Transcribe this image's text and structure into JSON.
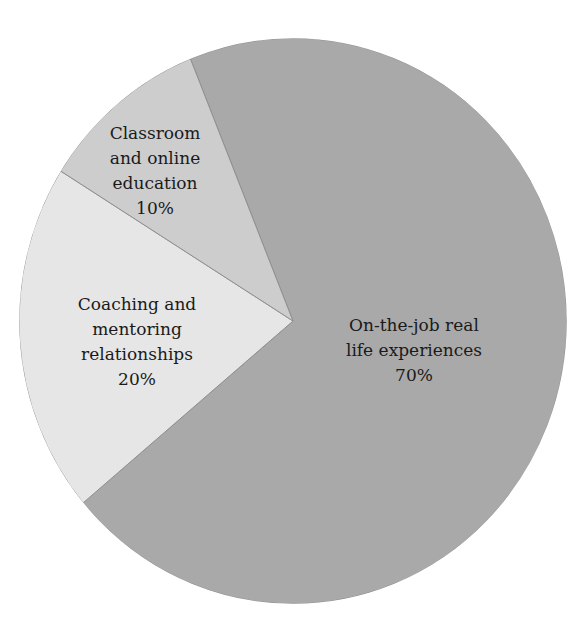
{
  "chart_data": {
    "type": "pie",
    "title": "",
    "categories": [
      "On-the-job real life experiences",
      "Coaching and mentoring relationships",
      "Classroom and online education"
    ],
    "values": [
      70,
      20,
      10
    ],
    "unit": "%",
    "colors": [
      "#a9a9a9",
      "#e6e6e6",
      "#cdcdcd"
    ],
    "start_angle_deg_from_top_clockwise": -22,
    "legend": "none (labels inside slices)",
    "labels": [
      {
        "lines": [
          "On-the-job real",
          "life experiences"
        ],
        "value": "70%"
      },
      {
        "lines": [
          "Coaching and",
          "mentoring",
          "relationships"
        ],
        "value": "20%"
      },
      {
        "lines": [
          "Classroom",
          "and online",
          "education"
        ],
        "value": "10%"
      }
    ]
  },
  "geometry": {
    "cx": 293,
    "cy": 321,
    "rx": 274,
    "ry": 283
  },
  "label_positions": [
    {
      "x": 414,
      "y": 313
    },
    {
      "x": 137,
      "y": 292
    },
    {
      "x": 155,
      "y": 121
    }
  ]
}
